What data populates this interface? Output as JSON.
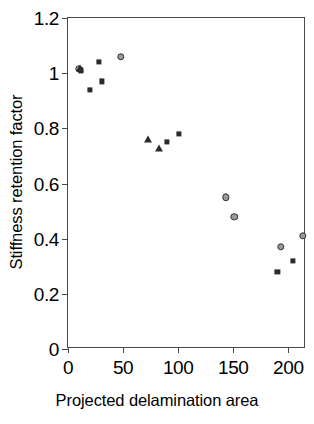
{
  "chart_data": {
    "type": "scatter",
    "title": "",
    "xlabel": "Projected delamination area",
    "ylabel": "Stiffness retention factor",
    "xlim": [
      0,
      216
    ],
    "ylim": [
      0,
      1.2
    ],
    "xticks": [
      0,
      50,
      100,
      150,
      200
    ],
    "yticks": [
      0,
      0.2,
      0.4,
      0.6,
      0.8,
      1,
      1.2
    ],
    "xtick_labels": [
      "0",
      "50",
      "100",
      "150",
      "200"
    ],
    "ytick_labels": [
      "0",
      "0.2",
      "0.4",
      "0.6",
      "0.8",
      "1",
      "1.2"
    ],
    "grid": false,
    "legend": false,
    "series": [
      {
        "name": "circle-series",
        "marker": "circle",
        "color": "#2f2f2f",
        "points": [
          {
            "x": 10,
            "y": 1.015
          },
          {
            "x": 48,
            "y": 1.06
          },
          {
            "x": 143,
            "y": 0.55
          },
          {
            "x": 151,
            "y": 0.48
          },
          {
            "x": 193,
            "y": 0.37
          },
          {
            "x": 213,
            "y": 0.41
          }
        ]
      },
      {
        "name": "square-series",
        "marker": "square",
        "color": "#2b2b2b",
        "points": [
          {
            "x": 12,
            "y": 1.01
          },
          {
            "x": 20,
            "y": 0.94
          },
          {
            "x": 28,
            "y": 1.04
          },
          {
            "x": 31,
            "y": 0.97
          },
          {
            "x": 90,
            "y": 0.75
          },
          {
            "x": 101,
            "y": 0.78
          },
          {
            "x": 190,
            "y": 0.28
          },
          {
            "x": 204,
            "y": 0.32
          }
        ]
      },
      {
        "name": "triangle-series",
        "marker": "triangle",
        "color": "#2b2b2b",
        "points": [
          {
            "x": 11,
            "y": 1.02
          },
          {
            "x": 73,
            "y": 0.76
          },
          {
            "x": 83,
            "y": 0.73
          }
        ]
      }
    ]
  },
  "axes": {
    "x_title": "Projected delamination area",
    "y_title": "Stiffness retention factor"
  },
  "colors": {
    "frame": "#4a4a4a",
    "marker_dark": "#2b2b2b",
    "circle_fill": "#9a9a9a",
    "background": "#ffffff"
  }
}
